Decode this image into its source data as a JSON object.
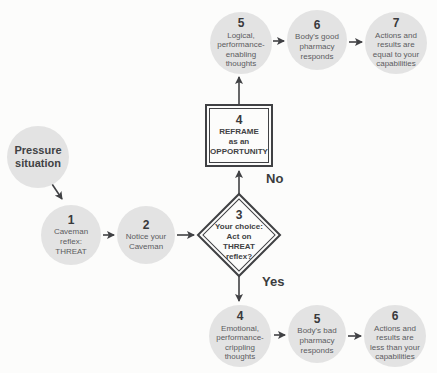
{
  "colors": {
    "background": "#fcfcfb",
    "circle_fill": "#e3e3e3",
    "text_dark": "#3b3c3e",
    "text_muted": "#5b5c5f",
    "line": "#404144"
  },
  "nodes": {
    "pressure": {
      "label": "Pressure\nsituation"
    },
    "caveman_reflex": {
      "num": "1",
      "label": "Caveman\nreflex:\nTHREAT"
    },
    "notice_caveman": {
      "num": "2",
      "label": "Notice your\nCaveman"
    },
    "choice": {
      "num": "3",
      "label": "Your choice:\nAct on\nTHREAT\nreflex?"
    },
    "reframe": {
      "num": "4",
      "label": "REFRAME\nas an\nOPPORTUNITY"
    },
    "logical_thoughts": {
      "num": "5",
      "label": "Logical,\nperformance-\nenabling\nthoughts"
    },
    "good_pharmacy": {
      "num": "6",
      "label": "Body's good\npharmacy\nresponds"
    },
    "equal_results": {
      "num": "7",
      "label": "Actions and\nresults are\nequal to your\ncapabilities"
    },
    "emotional_thoughts": {
      "num": "4",
      "label": "Emotional,\nperformance-\ncrippling\nthoughts"
    },
    "bad_pharmacy": {
      "num": "5",
      "label": "Body's bad\npharmacy\nresponds"
    },
    "lesser_results": {
      "num": "6",
      "label": "Actions and\nresults are\nless than your\ncapabilities"
    }
  },
  "edge_labels": {
    "no": "No",
    "yes": "Yes"
  }
}
